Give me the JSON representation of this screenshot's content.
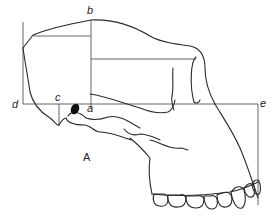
{
  "figure": {
    "caption": "A",
    "colors": {
      "outline": "#2a2a2a",
      "measure_lines": "#555555",
      "background": "#ffffff"
    },
    "labels": {
      "a": "a",
      "b": "b",
      "c": "c",
      "d": "d",
      "e": "e"
    }
  }
}
